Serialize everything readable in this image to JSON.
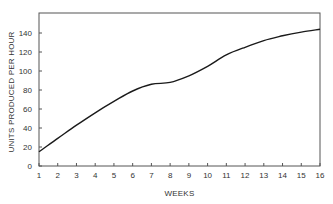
{
  "chart_data": {
    "type": "line",
    "title": "",
    "xlabel": "WEEKS",
    "ylabel": "UNITS PRODUCED PER HOUR",
    "x": [
      1,
      2,
      3,
      4,
      5,
      6,
      7,
      8,
      9,
      10,
      11,
      12,
      13,
      14,
      15,
      16
    ],
    "series": [
      {
        "name": "Units produced per hour",
        "values": [
          15,
          29,
          43,
          56,
          68,
          79,
          86,
          88,
          95,
          105,
          117,
          125,
          132,
          137,
          141,
          144
        ]
      }
    ],
    "xlim": [
      1,
      16
    ],
    "ylim": [
      0,
      160
    ],
    "x_ticks": [
      "1",
      "2",
      "3",
      "4",
      "5",
      "6",
      "7",
      "8",
      "9",
      "10",
      "11",
      "12",
      "13",
      "14",
      "15",
      "16"
    ],
    "y_ticks": [
      "0",
      "20",
      "40",
      "60",
      "80",
      "100",
      "120",
      "140"
    ],
    "grid": false,
    "legend": null,
    "line_color": "#1a1a1a"
  }
}
